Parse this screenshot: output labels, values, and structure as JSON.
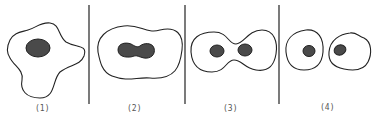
{
  "diagram": {
    "panels": [
      {
        "label": "(1)",
        "description": "irregular cell with single nucleus"
      },
      {
        "label": "(2)",
        "description": "elongated cell with dumbbell-shaped nucleus"
      },
      {
        "label": "(3)",
        "description": "constricting cell with two nuclei"
      },
      {
        "label": "(4)",
        "description": "two separate daughter cells each with one nucleus"
      }
    ],
    "colors": {
      "stroke": "#222222",
      "nucleus_fill": "#4a4a4a",
      "label": "#555555"
    }
  }
}
